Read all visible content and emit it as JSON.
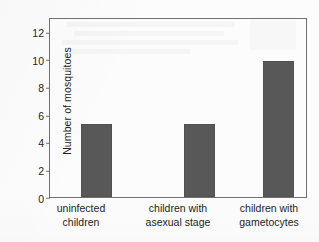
{
  "chart_data": {
    "type": "bar",
    "title": "",
    "subtitle": "",
    "xlabel": "",
    "ylabel": "Number of mosquitoes",
    "categories": [
      "uninfected children",
      "children with asexual stage",
      "children with gametocytes"
    ],
    "category_lines": [
      [
        "uninfected",
        "children"
      ],
      [
        "children with",
        "asexual stage"
      ],
      [
        "children with",
        "gametocytes"
      ]
    ],
    "values": [
      5.35,
      5.3,
      9.9
    ],
    "ylim": [
      0,
      13
    ],
    "yticks": [
      0,
      2,
      4,
      6,
      8,
      10,
      12
    ],
    "ytick_labels": [
      "0",
      "2",
      "4",
      "6",
      "8",
      "10",
      "12"
    ],
    "grid": false,
    "legend": false,
    "legend_position": "none",
    "bar_color": "#585858",
    "axis_color": "#6f7275",
    "background_color": "#fcfcfc"
  }
}
